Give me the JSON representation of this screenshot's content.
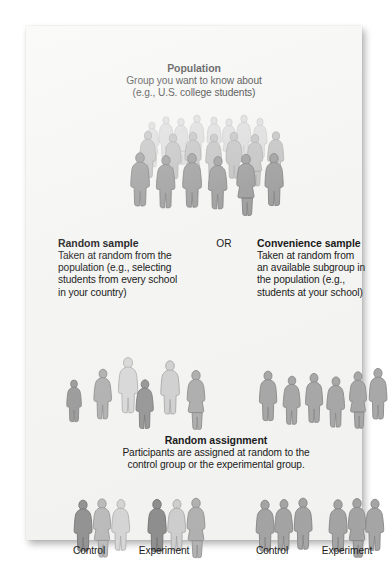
{
  "figure": {
    "kind": "sampling-and-assignment-diagram",
    "card_background": "#f4f4f2",
    "text_color": "#1b1b1b"
  },
  "population": {
    "heading": "Population",
    "line1": "Group you want to know about",
    "line2": "(e.g., U.S. college students)",
    "crowd": {
      "description": "large crowd of human silhouettes in three depth rows",
      "count": 21,
      "back_row_color": "#d9d9d9",
      "middle_row_color": "#bdbdbd",
      "front_row_color": "#9c9c9c",
      "outline_color": "#8e8e8e"
    }
  },
  "random_sample": {
    "heading": "Random sample",
    "line1": "Taken at random from the",
    "line2": "population (e.g., selecting",
    "line3": "students from every school",
    "line4": "in your country)",
    "people": {
      "description": "six scattered silhouettes of mixed shades and sizes",
      "count": 6
    }
  },
  "or_label": "OR",
  "convenience_sample": {
    "heading": "Convenience sample",
    "line1": "Taken at random from",
    "line2": "an available subgroup in",
    "line3": "the population (e.g.,",
    "line4": "students at your school)",
    "people": {
      "description": "six evenly spaced silhouettes of similar mid-gray shade",
      "count": 6
    }
  },
  "random_assignment": {
    "heading": "Random assignment",
    "line1": "Participants are assigned at random to the",
    "line2": "control group or the experimental group.",
    "groups": [
      {
        "caption": "Control",
        "count": 3,
        "from": "random_sample"
      },
      {
        "caption": "Experiment",
        "count": 3,
        "from": "random_sample"
      },
      {
        "caption": "Control",
        "count": 3,
        "from": "convenience_sample"
      },
      {
        "caption": "Experiment",
        "count": 3,
        "from": "convenience_sample"
      }
    ]
  },
  "palette": {
    "lightest": "#dcdcdc",
    "light": "#cccccc",
    "mid_light": "#bbbbbb",
    "mid": "#ababab",
    "mid_dark": "#9c9c9c",
    "dark": "#8d8d8d",
    "outline": "#878787"
  }
}
